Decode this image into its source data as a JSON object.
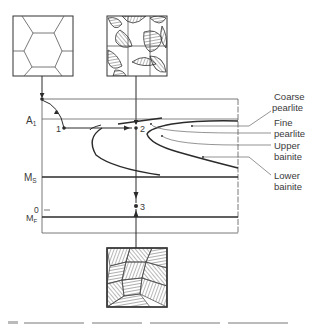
{
  "diagram": {
    "type": "TTT isothermal transformation diagram",
    "axis_labels": {
      "a1": "A",
      "a1_sub": "1",
      "ms": "M",
      "ms_sub": "S",
      "zero": "0",
      "mf": "M",
      "mf_sub": "F"
    },
    "points": [
      {
        "id": "1",
        "label": "1"
      },
      {
        "id": "2",
        "label": "2"
      },
      {
        "id": "3",
        "label": "3"
      }
    ],
    "microstructures": [
      {
        "name": "austenite-grains",
        "position": "top-left"
      },
      {
        "name": "pearlite-at-grain-boundaries",
        "position": "top-center"
      },
      {
        "name": "martensite-plates",
        "position": "bottom-center"
      }
    ],
    "legend": [
      {
        "line1": "Coarse",
        "line2": "pearlite"
      },
      {
        "line1": "Fine",
        "line2": "pearlite"
      },
      {
        "line1": "Upper",
        "line2": "bainite"
      },
      {
        "line1": "Lower",
        "line2": "bainite"
      }
    ],
    "colors": {
      "ink": "#2b2b2b",
      "thin": "#555555",
      "background": "#ffffff"
    }
  }
}
